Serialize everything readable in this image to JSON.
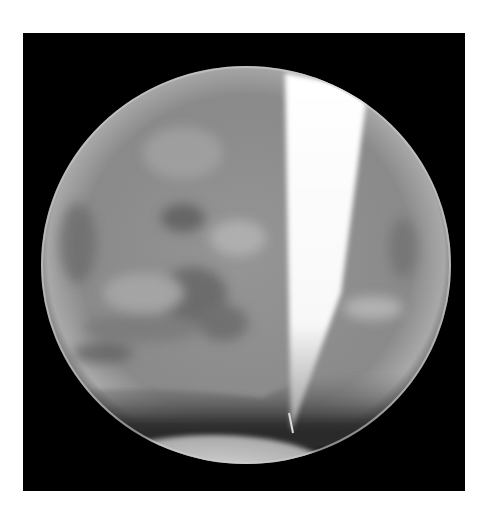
{
  "image": {
    "description": "Grayscale telescope photograph of a planetary disk (Mars-like) on black background with a bright white wedge-shaped streak and dark southern band",
    "colors": {
      "background": "#ffffff",
      "frame": "#000000",
      "disk_base": "#8e8e8e",
      "wedge": "#fbfbfb",
      "dark_band": "#2a2a2a"
    }
  }
}
